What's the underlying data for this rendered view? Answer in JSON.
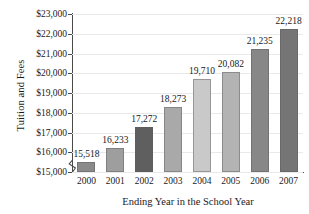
{
  "chart_data": {
    "type": "bar",
    "title": "",
    "xlabel": "Ending Year in the School Year",
    "ylabel": "Tuition and Fees",
    "categories": [
      "2000",
      "2001",
      "2002",
      "2003",
      "2004",
      "2005",
      "2006",
      "2007"
    ],
    "values": [
      15518,
      16233,
      17272,
      18273,
      19710,
      20082,
      21235,
      22218
    ],
    "value_labels": [
      "15,518",
      "16,233",
      "17,272",
      "18,273",
      "19,710",
      "20,082",
      "21,235",
      "22,218"
    ],
    "bar_colors": [
      "#8a8a8a",
      "#9e9e9e",
      "#5f5f5f",
      "#a9a9a9",
      "#c9c9c9",
      "#b3b3b3",
      "#878787",
      "#757575"
    ],
    "ylim": [
      15000,
      23000
    ],
    "ytick_values": [
      15000,
      16000,
      17000,
      18000,
      19000,
      20000,
      21000,
      22000,
      23000
    ],
    "ytick_labels": [
      "$15,000",
      "$16,000",
      "$17,000",
      "$18,000",
      "$19,000",
      "$20,000",
      "$21,000",
      "$22,000",
      "$23,000"
    ],
    "grid": true,
    "grid_axis": "y",
    "legend": "none",
    "axis_break": true,
    "axis_break_note": "zigzag break marker on y-axis below $15,000"
  }
}
